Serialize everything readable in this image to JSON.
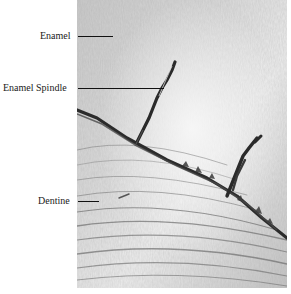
{
  "figure": {
    "labels": [
      {
        "id": "enamel",
        "text": "Enamel"
      },
      {
        "id": "enamel-spindle",
        "text": "Enamel Spindle"
      },
      {
        "id": "dentine",
        "text": "Dentine"
      }
    ]
  },
  "colors": {
    "background": "#ffffff",
    "text": "#1a1a1a",
    "photo_light": "#ececec",
    "photo_mid": "#b8b8b8",
    "photo_dark": "#2a2a2a"
  }
}
